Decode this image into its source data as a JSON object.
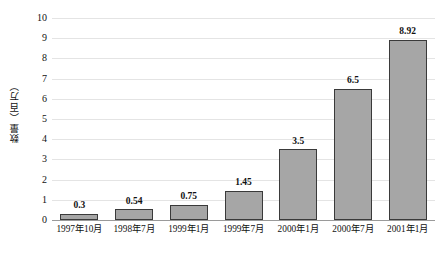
{
  "chart_data": {
    "type": "bar",
    "title": "",
    "subtitle": "",
    "xlabel": "",
    "ylabel": "数量（百万）",
    "categories": [
      "1997年10月",
      "1998年7月",
      "1999年1月",
      "1999年7月",
      "2000年1月",
      "2000年7月",
      "2001年1月"
    ],
    "values": [
      0.3,
      0.54,
      0.75,
      1.45,
      3.5,
      6.5,
      8.92
    ],
    "value_labels": [
      "0.3",
      "0.54",
      "0.75",
      "1.45",
      "3.5",
      "6.5",
      "8.92"
    ],
    "ylim": [
      0,
      10
    ],
    "ytick_labels": [
      "0",
      "1",
      "2",
      "3",
      "4",
      "5",
      "6",
      "7",
      "8",
      "9",
      "10"
    ],
    "ytick_values": [
      0,
      1,
      2,
      3,
      4,
      5,
      6,
      7,
      8,
      9,
      10
    ],
    "grid": "horizontal",
    "legend": "none",
    "legend_position": "none",
    "colors": {
      "bar_fill": "#a6a6a6",
      "bar_border": "#3a3a3a",
      "gridline": "#e4e4e4",
      "axis": "#9a9a9a",
      "text": "#111111",
      "background": "#ffffff"
    }
  }
}
